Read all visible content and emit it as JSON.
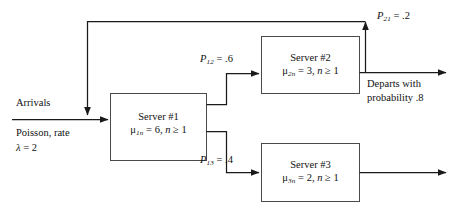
{
  "diagram": {
    "type": "queueing-network",
    "stroke_color": "#1a1a1a",
    "box_stroke_color": "#4a4a4a",
    "background": "#ffffff"
  },
  "arrivals": {
    "label": "Arrivals",
    "line1": "Poisson, rate",
    "lambda_symbol": "λ",
    "lambda_eq": "= 2",
    "rate": 2
  },
  "servers": [
    {
      "id": "server-1",
      "name": "Server #1",
      "mu_symbol": "μ",
      "mu_sub": "1n",
      "mu_eq": "= 6,",
      "n_symbol": "n",
      "n_cond": "≥ 1",
      "rate": 6
    },
    {
      "id": "server-2",
      "name": "Server #2",
      "mu_symbol": "μ",
      "mu_sub": "2n",
      "mu_eq": "= 3,",
      "n_symbol": "n",
      "n_cond": "≥ 1",
      "rate": 3
    },
    {
      "id": "server-3",
      "name": "Server #3",
      "mu_symbol": "μ",
      "mu_sub": "3n",
      "mu_eq": "= 2,",
      "n_symbol": "n",
      "n_cond": "≥ 1",
      "rate": 2
    }
  ],
  "routing": [
    {
      "id": "p12",
      "symbol": "P",
      "sub": "12",
      "eq": "= .6",
      "value": 0.6,
      "from": "server-1",
      "to": "server-2"
    },
    {
      "id": "p13",
      "symbol": "P",
      "sub": "13",
      "eq": "= .4",
      "value": 0.4,
      "from": "server-1",
      "to": "server-3"
    },
    {
      "id": "p21",
      "symbol": "P",
      "sub": "21",
      "eq": "= .2",
      "value": 0.2,
      "from": "server-2",
      "to": "server-1"
    }
  ],
  "departure": {
    "line1": "Departs with",
    "line2": "probability .8",
    "probability": 0.8
  }
}
